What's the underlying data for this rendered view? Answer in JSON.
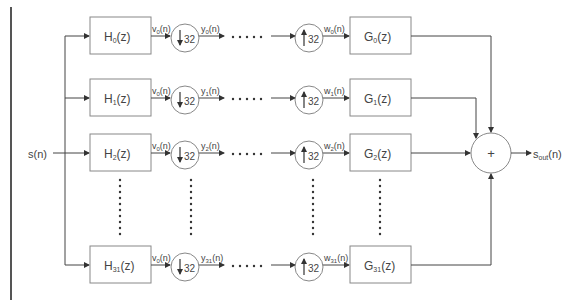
{
  "diagram": {
    "title": "",
    "input_label": "s(n)",
    "output_label_main": "s",
    "output_label_sub": "out",
    "output_label_tail": "(n)",
    "sum_symbol": "+",
    "factor": "32",
    "ellipsis_h": "• • • • •",
    "rows": [
      {
        "y": 36,
        "h_main": "H",
        "h_sub": "0",
        "v_main": "v",
        "v_sub": "0",
        "y_main": "y",
        "y_sub": "0",
        "w_main": "w",
        "w_sub": "0",
        "g_main": "G",
        "g_sub": "0"
      },
      {
        "y": 98,
        "h_main": "H",
        "h_sub": "1",
        "v_main": "v",
        "v_sub": "0",
        "y_main": "y",
        "y_sub": "1",
        "w_main": "w",
        "w_sub": "1",
        "g_main": "G",
        "g_sub": "1"
      },
      {
        "y": 153,
        "h_main": "H",
        "h_sub": "2",
        "v_main": "v",
        "v_sub": "0",
        "y_main": "y",
        "y_sub": "2",
        "w_main": "w",
        "w_sub": "2",
        "g_main": "G",
        "g_sub": "2"
      },
      {
        "y": 265,
        "h_main": "H",
        "h_sub": "31",
        "v_main": "v",
        "v_sub": "0",
        "y_main": "y",
        "y_sub": "31",
        "w_main": "w",
        "w_sub": "31",
        "g_main": "G",
        "g_sub": "31"
      }
    ],
    "z_suffix": "(z)",
    "n_suffix": "(n)",
    "colors": {
      "line": "#444444",
      "box_stroke": "#888888",
      "text": "#444444"
    }
  }
}
